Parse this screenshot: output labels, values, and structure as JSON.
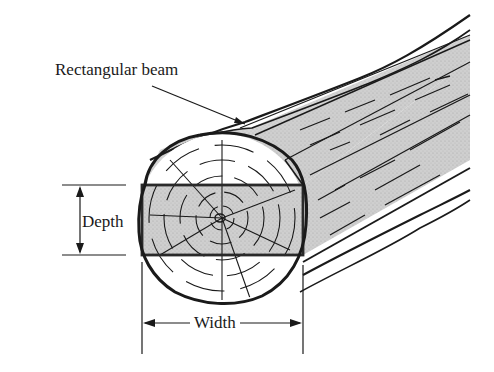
{
  "figure": {
    "type": "engineering-illustration",
    "labels": {
      "beam": "Rectangular beam",
      "depth": "Depth",
      "width": "Width"
    },
    "dimensions": [
      {
        "name": "depth",
        "label": "Depth",
        "orientation": "vertical",
        "arrows": "double-headed"
      },
      {
        "name": "width",
        "label": "Width",
        "orientation": "horizontal",
        "arrows": "double-headed"
      }
    ],
    "colors": {
      "ink": "#1a1a1a",
      "beam_fill": "#c9c9c9",
      "log_fill": "#ffffff",
      "background": "#ffffff"
    }
  }
}
